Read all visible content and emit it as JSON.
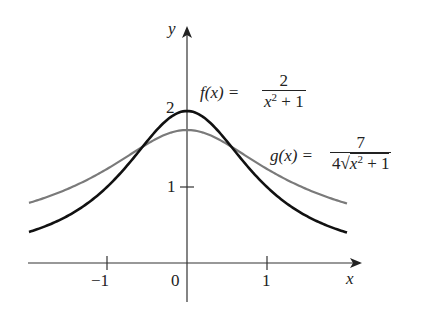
{
  "chart_data": {
    "type": "line",
    "title": "",
    "xlabel": "x",
    "ylabel": "y",
    "x_ticks": [
      {
        "value": -1,
        "label": "−1"
      },
      {
        "value": 0,
        "label": "0"
      },
      {
        "value": 1,
        "label": "1"
      }
    ],
    "y_ticks": [
      {
        "value": 1,
        "label": "1"
      },
      {
        "value": 2,
        "label": "2"
      }
    ],
    "xlim": [
      -2,
      2.2
    ],
    "ylim": [
      0,
      2.8
    ],
    "grid": false,
    "legend": "inline annotations",
    "series": [
      {
        "name": "f(x) = 2/(x^2 + 1)",
        "label_lhs": "f(x) =",
        "label_num": "2",
        "label_den": "x² + 1",
        "color": "#111111",
        "x": [
          -2,
          -1.5,
          -1,
          -0.5,
          0,
          0.5,
          1,
          1.5,
          2
        ],
        "values": [
          0.4,
          0.615,
          1.0,
          1.6,
          2.0,
          1.6,
          1.0,
          0.615,
          0.4
        ]
      },
      {
        "name": "g(x) = 7/(4√(x^2 + 1))",
        "label_lhs": "g(x) =",
        "label_num": "7",
        "label_den": "4√x² + 1",
        "color": "#777777",
        "x": [
          -2,
          -1.5,
          -1,
          -0.5,
          0,
          0.5,
          1,
          1.5,
          2
        ],
        "values": [
          0.78,
          0.97,
          1.24,
          1.57,
          1.75,
          1.57,
          1.24,
          0.97,
          0.78
        ]
      }
    ]
  },
  "labels": {
    "y_axis": "y",
    "x_axis": "x",
    "tick_neg1": "−1",
    "tick_0": "0",
    "tick_1": "1",
    "tick_y1": "1",
    "tick_y2": "2",
    "f_lhs": "f(x) =",
    "f_num": "2",
    "f_den_base": "x",
    "f_den_exp": "2",
    "f_den_rest": " + 1",
    "g_lhs": "g(x) =",
    "g_num": "7",
    "g_den_coef": "4",
    "g_den_base": "x",
    "g_den_exp": "2",
    "g_den_rest": " + 1"
  }
}
